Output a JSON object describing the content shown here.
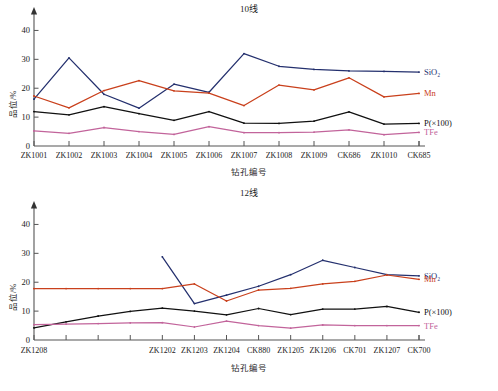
{
  "figure": {
    "caption": "",
    "axis_x_label": "钻孔编号",
    "axis_y_label": "品位/%"
  },
  "series_colors": {
    "SiO2": "#24306e",
    "Mn": "#c9401c",
    "P": "#111111",
    "TFe": "#c2649b"
  },
  "series_labels": {
    "SiO2": "SiO₂",
    "Mn": "Mn",
    "P": "P(×100)",
    "TFe": "TFe"
  },
  "chart_data": [
    {
      "type": "line",
      "id": "line10",
      "title": "10线",
      "xlabel": "钻孔编号",
      "ylabel": "品位/%",
      "ylim": [
        0,
        45
      ],
      "yticks": [
        0,
        10,
        20,
        30,
        40
      ],
      "grid": false,
      "legend": "right-inline",
      "categories": [
        "ZK1001",
        "ZK1002",
        "ZK1003",
        "ZK1004",
        "ZK1005",
        "ZK1006",
        "ZK1007",
        "ZK1008",
        "ZK1009",
        "CK686",
        "ZK1010",
        "CK685"
      ],
      "series": [
        {
          "name": "SiO₂",
          "key": "SiO2",
          "color": "#24306e",
          "values": [
            16.2,
            30.5,
            17.9,
            13.1,
            21.4,
            18.6,
            32.0,
            27.6,
            26.5,
            26.0,
            25.8,
            25.6
          ]
        },
        {
          "name": "Mn",
          "key": "Mn",
          "color": "#c9401c",
          "values": [
            17.3,
            13.2,
            19.2,
            22.6,
            19.1,
            18.3,
            14.0,
            21.1,
            19.4,
            23.6,
            17.0,
            18.2
          ]
        },
        {
          "name": "P(×100)",
          "key": "P",
          "color": "#111111",
          "values": [
            11.9,
            10.8,
            13.6,
            11.2,
            8.9,
            11.9,
            7.9,
            7.8,
            8.6,
            11.8,
            7.6,
            7.8
          ]
        },
        {
          "name": "TFe",
          "key": "TFe",
          "color": "#c2649b",
          "values": [
            5.2,
            4.4,
            6.4,
            5.0,
            4.0,
            6.7,
            4.6,
            4.6,
            4.8,
            5.6,
            3.9,
            4.7
          ]
        }
      ]
    },
    {
      "type": "line",
      "id": "line12",
      "title": "12线",
      "xlabel": "钻孔编号",
      "ylabel": "品位/%",
      "ylim": [
        0,
        45
      ],
      "yticks": [
        0,
        10,
        20,
        30,
        40
      ],
      "grid": false,
      "legend": "right-inline",
      "categories": [
        "ZK1208",
        "",
        "",
        "",
        "ZK1202",
        "ZK1203",
        "ZK1204",
        "CK880",
        "ZK1205",
        "ZK1206",
        "CK701",
        "ZK1207",
        "CK700"
      ],
      "series": [
        {
          "name": "SiO₂",
          "key": "SiO2",
          "color": "#24306e",
          "start_index": 4,
          "values": [
            null,
            null,
            null,
            null,
            28.8,
            12.6,
            15.5,
            18.6,
            22.6,
            27.6,
            25.1,
            22.6,
            22.2
          ]
        },
        {
          "name": "Mn",
          "key": "Mn",
          "color": "#c9401c",
          "start_index": 0,
          "values": [
            17.8,
            17.8,
            17.8,
            17.8,
            17.8,
            19.4,
            13.5,
            17.3,
            17.9,
            19.4,
            20.3,
            22.5,
            21.0
          ]
        },
        {
          "name": "P(×100)",
          "key": "P",
          "color": "#111111",
          "start_index": 0,
          "values": [
            4.2,
            6.3,
            8.3,
            9.9,
            11.0,
            10.0,
            8.7,
            10.9,
            8.8,
            10.7,
            10.7,
            11.6,
            9.6
          ]
        },
        {
          "name": "TFe",
          "key": "TFe",
          "color": "#c2649b",
          "start_index": 0,
          "values": [
            5.3,
            5.5,
            5.7,
            5.9,
            6.0,
            4.5,
            6.5,
            5.0,
            4.1,
            5.2,
            5.0,
            5.0,
            5.0
          ]
        }
      ]
    }
  ]
}
